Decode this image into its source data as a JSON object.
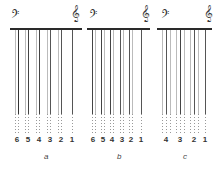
{
  "figure": {
    "panels": [
      {
        "id": "a",
        "label": "a",
        "bass_clef": "𝄢",
        "treble_clef": "𝄞",
        "course_numbers": [
          "6",
          "5",
          "4",
          "3",
          "2",
          "1"
        ]
      },
      {
        "id": "b",
        "label": "b",
        "bass_clef": "𝄢",
        "treble_clef": "𝄞",
        "course_numbers": [
          "6",
          "5",
          "4",
          "3",
          "2",
          "1"
        ]
      },
      {
        "id": "c",
        "label": "c",
        "bass_clef": "𝄢",
        "treble_clef": "𝄞",
        "course_numbers": [
          "4",
          "3",
          "2",
          "1"
        ]
      }
    ]
  },
  "colors": {
    "ink": "#2a2a2a",
    "string_dark": "#444444",
    "string_light": "#b0b0b0",
    "background": "#ffffff"
  }
}
